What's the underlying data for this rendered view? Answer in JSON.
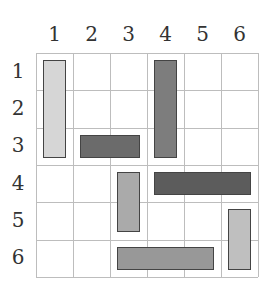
{
  "board": {
    "rows": 6,
    "cols": 6,
    "col_labels": [
      "1",
      "2",
      "3",
      "4",
      "5",
      "6"
    ],
    "row_labels": [
      "1",
      "2",
      "3",
      "4",
      "5",
      "6"
    ],
    "grid_color": "#bdbdbd"
  },
  "blocks": [
    {
      "id": "A",
      "col": 1,
      "row": 1,
      "orientation": "vertical",
      "length": 3,
      "color": "#d6d6d6"
    },
    {
      "id": "B",
      "col": 4,
      "row": 1,
      "orientation": "vertical",
      "length": 3,
      "color": "#7d7d7d"
    },
    {
      "id": "C",
      "col": 2,
      "row": 3,
      "orientation": "horizontal",
      "length": 2,
      "color": "#6b6b6b"
    },
    {
      "id": "D",
      "col": 3,
      "row": 4,
      "orientation": "vertical",
      "length": 2,
      "color": "#aaaaaa"
    },
    {
      "id": "E",
      "col": 4,
      "row": 4,
      "orientation": "horizontal",
      "length": 3,
      "color": "#5c5c5c"
    },
    {
      "id": "F",
      "col": 6,
      "row": 5,
      "orientation": "vertical",
      "length": 2,
      "color": "#bfbfbf"
    },
    {
      "id": "G",
      "col": 3,
      "row": 6,
      "orientation": "horizontal",
      "length": 3,
      "color": "#989898"
    }
  ]
}
